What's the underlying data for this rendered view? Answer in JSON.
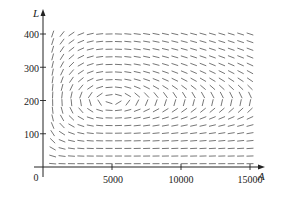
{
  "chart_data": {
    "type": "direction_field",
    "title": "",
    "xlabel": "A",
    "ylabel": "L",
    "xlim": [
      0,
      16000
    ],
    "ylim": [
      0,
      430
    ],
    "xticks": [
      5000,
      10000,
      15000
    ],
    "yticks": [
      100,
      200,
      300,
      400
    ],
    "tick_labels": {
      "x": [
        "5000",
        "10000",
        "15000"
      ],
      "y": [
        "100",
        "200",
        "300",
        "400"
      ],
      "origin": "0"
    },
    "grid": false,
    "legend": null,
    "system": {
      "dA_dt": "2A - 0.01AL",
      "dL_dt": "-0.5L + 0.0001AL",
      "equilibrium": [
        5000,
        200
      ]
    },
    "field_grid": {
      "a_start": 700,
      "a_end": 15000,
      "a_count": 22,
      "l_start": 10,
      "l_end": 400,
      "l_count": 18
    },
    "colors": {
      "segment": "#666666",
      "axis": "#222222"
    }
  }
}
